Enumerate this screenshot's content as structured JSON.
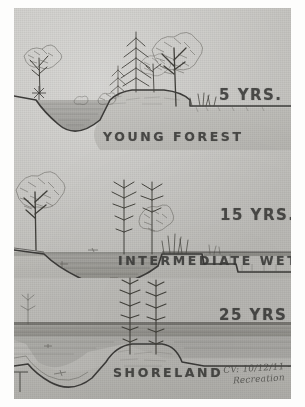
{
  "document": {
    "kind": "pencil-sketch-scan",
    "title": "Shoreland Succession Cross-Sections",
    "panel_count": 3
  },
  "palette": {
    "paper": "#c5c4c0",
    "page_margin": "#fdfdfc",
    "graphite": "#3a3a38",
    "water": "#9a9a96",
    "soil_dark": "#55544f",
    "ground": "#b4b3ae"
  },
  "panels": [
    {
      "id": "panel-1",
      "years_label": "5 YRS.",
      "caption": "YOUNG FOREST",
      "scene": {
        "description": "Cross-section of a shoreline with a deep water-filled basin at left, a rising earthen bank, and a stand of young deciduous and conifer trees along the crest. Flat ground continues to the right with tufts of grass.",
        "water_body": "left basin, open water",
        "vegetation": [
          "young deciduous tree at far left",
          "conifer sapling",
          "mixed broadleaf trees on bank crest",
          "grass tufts at right"
        ],
        "terrain": "steep-sided excavated basin, high bank"
      }
    },
    {
      "id": "panel-2",
      "years_label": "15 YRS.",
      "caption": "INTERMEDIATE WETLAND",
      "scene": {
        "description": "The basin has partly filled and broadened into shallow open water. A mature broadleaf tree stands at left, dead and dying conifer snags rise from the centre, and a stepped ledge with emergent stems sits at right.",
        "water_body": "broad shallow pond, water level raised to grade",
        "vegetation": [
          "mature deciduous tree at left",
          "standing conifer snags centre",
          "shrubs and emergent stems right"
        ],
        "terrain": "shallower bowl, stepped right-hand ledge"
      }
    },
    {
      "id": "panel-3",
      "years_label": "25 YRS",
      "caption": "SHORELAND",
      "scene": {
        "description": "Water now extends across the full width as a broad shoreland flat. Two bare conifer snags stand on a low central mound of sediment; a residual depression remains at far left.",
        "water_body": "open water spanning the section",
        "vegetation": [
          "two bare conifer snags on central mound"
        ],
        "terrain": "low central sediment mound, residual depression at left"
      }
    }
  ],
  "annotation": {
    "name": "archival-note",
    "line1": "CV: 10/12/11 - virg",
    "line2": "Recreation"
  }
}
